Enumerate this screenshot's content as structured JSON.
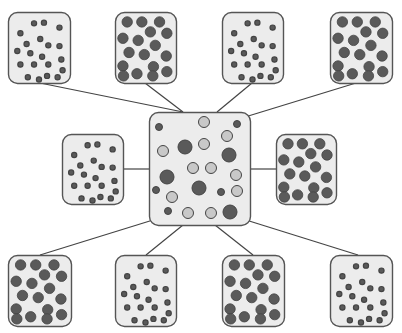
{
  "diagram": {
    "type": "hub-and-spoke",
    "colors": {
      "background": "#ffffff",
      "box_fill": "#ececec",
      "box_stroke": "#555555",
      "line": "#444444",
      "particle_dark": "#5a5a5a",
      "particle_light": "#c8c8c8",
      "particle_stroke": "#444444"
    },
    "center": {
      "name": "mixture-container",
      "x": 149,
      "y": 112,
      "w": 101,
      "h": 113,
      "particles": [
        {
          "x": 159,
          "y": 127,
          "r": 3.5,
          "c": "dark"
        },
        {
          "x": 204,
          "y": 122,
          "r": 5.5,
          "c": "light"
        },
        {
          "x": 237,
          "y": 124,
          "r": 3.5,
          "c": "dark"
        },
        {
          "x": 227,
          "y": 136,
          "r": 5.5,
          "c": "light"
        },
        {
          "x": 163,
          "y": 151,
          "r": 5.5,
          "c": "light"
        },
        {
          "x": 185,
          "y": 147,
          "r": 7,
          "c": "dark"
        },
        {
          "x": 204,
          "y": 144,
          "r": 5.5,
          "c": "light"
        },
        {
          "x": 229,
          "y": 155,
          "r": 7,
          "c": "dark"
        },
        {
          "x": 193,
          "y": 168,
          "r": 5.5,
          "c": "light"
        },
        {
          "x": 211,
          "y": 168,
          "r": 5.5,
          "c": "light"
        },
        {
          "x": 236,
          "y": 175,
          "r": 5.5,
          "c": "light"
        },
        {
          "x": 167,
          "y": 177,
          "r": 7,
          "c": "dark"
        },
        {
          "x": 156,
          "y": 190,
          "r": 3.5,
          "c": "dark"
        },
        {
          "x": 172,
          "y": 197,
          "r": 5.5,
          "c": "light"
        },
        {
          "x": 199,
          "y": 188,
          "r": 7,
          "c": "dark"
        },
        {
          "x": 221,
          "y": 192,
          "r": 3.5,
          "c": "dark"
        },
        {
          "x": 237,
          "y": 191,
          "r": 5.5,
          "c": "light"
        },
        {
          "x": 168,
          "y": 211,
          "r": 3.5,
          "c": "dark"
        },
        {
          "x": 188,
          "y": 213,
          "r": 5.5,
          "c": "light"
        },
        {
          "x": 211,
          "y": 213,
          "r": 5.5,
          "c": "light"
        },
        {
          "x": 230,
          "y": 212,
          "r": 7,
          "c": "dark"
        }
      ]
    },
    "satellites": [
      {
        "name": "small-particles-top-1",
        "x": 8,
        "y": 12,
        "w": 62,
        "h": 71,
        "kind": "small",
        "anchor": [
          40,
          83
        ]
      },
      {
        "name": "large-particles-top-2",
        "x": 115,
        "y": 12,
        "w": 61,
        "h": 71,
        "kind": "large",
        "anchor": [
          145,
          83
        ]
      },
      {
        "name": "small-particles-top-3",
        "x": 222,
        "y": 12,
        "w": 61,
        "h": 71,
        "kind": "small",
        "anchor": [
          252,
          83
        ]
      },
      {
        "name": "large-particles-top-4",
        "x": 330,
        "y": 12,
        "w": 62,
        "h": 71,
        "kind": "large",
        "anchor": [
          356,
          83
        ]
      },
      {
        "name": "small-particles-mid-left",
        "x": 62,
        "y": 134,
        "w": 61,
        "h": 70,
        "kind": "small",
        "anchor": [
          123,
          169
        ]
      },
      {
        "name": "large-particles-mid-right",
        "x": 276,
        "y": 134,
        "w": 60,
        "h": 70,
        "kind": "large",
        "anchor": [
          276,
          169
        ]
      },
      {
        "name": "large-particles-bottom-1",
        "x": 8,
        "y": 255,
        "w": 63,
        "h": 71,
        "kind": "large",
        "anchor": [
          40,
          255
        ]
      },
      {
        "name": "small-particles-bottom-2",
        "x": 115,
        "y": 255,
        "w": 61,
        "h": 71,
        "kind": "small",
        "anchor": [
          146,
          255
        ]
      },
      {
        "name": "large-particles-bottom-3",
        "x": 222,
        "y": 255,
        "w": 62,
        "h": 71,
        "kind": "large",
        "anchor": [
          253,
          255
        ]
      },
      {
        "name": "small-particles-bottom-4",
        "x": 330,
        "y": 255,
        "w": 62,
        "h": 71,
        "kind": "small",
        "anchor": [
          358,
          255
        ]
      }
    ],
    "connections": [
      {
        "from": [
          40,
          83
        ],
        "to": [
          183,
          112
        ]
      },
      {
        "from": [
          145,
          83
        ],
        "to": [
          183,
          112
        ]
      },
      {
        "from": [
          252,
          83
        ],
        "to": [
          217,
          112
        ]
      },
      {
        "from": [
          356,
          83
        ],
        "to": [
          245,
          117
        ]
      },
      {
        "from": [
          123,
          169
        ],
        "to": [
          149,
          169
        ]
      },
      {
        "from": [
          276,
          169
        ],
        "to": [
          250,
          169
        ]
      },
      {
        "from": [
          40,
          255
        ],
        "to": [
          153,
          220
        ]
      },
      {
        "from": [
          146,
          255
        ],
        "to": [
          183,
          225
        ]
      },
      {
        "from": [
          253,
          255
        ],
        "to": [
          215,
          225
        ]
      },
      {
        "from": [
          358,
          255
        ],
        "to": [
          246,
          220
        ]
      }
    ],
    "patterns": {
      "small": {
        "r": 2.6,
        "points": [
          [
            0.42,
            0.16
          ],
          [
            0.58,
            0.15
          ],
          [
            0.83,
            0.22
          ],
          [
            0.2,
            0.3
          ],
          [
            0.52,
            0.38
          ],
          [
            0.3,
            0.45
          ],
          [
            0.65,
            0.47
          ],
          [
            0.83,
            0.48
          ],
          [
            0.15,
            0.55
          ],
          [
            0.36,
            0.58
          ],
          [
            0.55,
            0.63
          ],
          [
            0.86,
            0.67
          ],
          [
            0.2,
            0.74
          ],
          [
            0.42,
            0.74
          ],
          [
            0.65,
            0.74
          ],
          [
            0.88,
            0.82
          ],
          [
            0.32,
            0.92
          ],
          [
            0.5,
            0.95
          ],
          [
            0.63,
            0.9
          ],
          [
            0.8,
            0.92
          ]
        ]
      },
      "large": {
        "r": 5.2,
        "points": [
          [
            0.2,
            0.14
          ],
          [
            0.44,
            0.14
          ],
          [
            0.73,
            0.14
          ],
          [
            0.58,
            0.28
          ],
          [
            0.85,
            0.3
          ],
          [
            0.13,
            0.37
          ],
          [
            0.38,
            0.4
          ],
          [
            0.66,
            0.47
          ],
          [
            0.23,
            0.57
          ],
          [
            0.48,
            0.6
          ],
          [
            0.84,
            0.62
          ],
          [
            0.13,
            0.76
          ],
          [
            0.63,
            0.77
          ],
          [
            0.85,
            0.84
          ],
          [
            0.14,
            0.9
          ],
          [
            0.36,
            0.87
          ],
          [
            0.62,
            0.9
          ]
        ]
      }
    }
  }
}
